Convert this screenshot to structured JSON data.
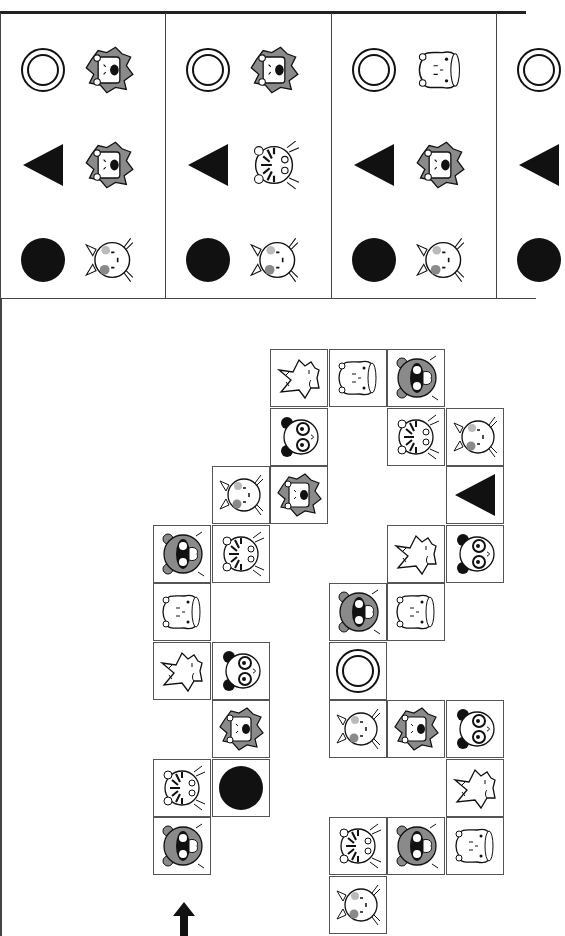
{
  "puzzle": {
    "type": "animal-path-grid",
    "key_panels": [
      {
        "rows": [
          {
            "symbol": "ring",
            "animal": "lion"
          },
          {
            "symbol": "triangle",
            "animal": "lion"
          },
          {
            "symbol": "dot",
            "animal": "cat"
          }
        ]
      },
      {
        "rows": [
          {
            "symbol": "ring",
            "animal": "lion"
          },
          {
            "symbol": "triangle",
            "animal": "tiger"
          },
          {
            "symbol": "dot",
            "animal": "cat"
          }
        ]
      },
      {
        "rows": [
          {
            "symbol": "ring",
            "animal": "hippo"
          },
          {
            "symbol": "triangle",
            "animal": "lion"
          },
          {
            "symbol": "dot",
            "animal": "cat"
          }
        ]
      },
      {
        "rows": [
          {
            "symbol": "ring",
            "animal": ""
          },
          {
            "symbol": "triangle",
            "animal": ""
          },
          {
            "symbol": "dot",
            "animal": ""
          }
        ]
      }
    ],
    "grid": {
      "cell_size": 58.5,
      "origin_x": 153,
      "origin_y": 349,
      "cells": [
        {
          "r": 0,
          "c": 2,
          "item": "fox"
        },
        {
          "r": 0,
          "c": 3,
          "item": "hippo"
        },
        {
          "r": 0,
          "c": 4,
          "item": "raccoon"
        },
        {
          "r": 1,
          "c": 2,
          "item": "panda"
        },
        {
          "r": 1,
          "c": 4,
          "item": "tiger"
        },
        {
          "r": 1,
          "c": 5,
          "item": "cat"
        },
        {
          "r": 2,
          "c": 1,
          "item": "cat"
        },
        {
          "r": 2,
          "c": 2,
          "item": "lion"
        },
        {
          "r": 2,
          "c": 5,
          "item": "triangle"
        },
        {
          "r": 3,
          "c": 0,
          "item": "raccoon"
        },
        {
          "r": 3,
          "c": 1,
          "item": "tiger"
        },
        {
          "r": 3,
          "c": 4,
          "item": "fox"
        },
        {
          "r": 3,
          "c": 5,
          "item": "panda"
        },
        {
          "r": 4,
          "c": 0,
          "item": "hippo"
        },
        {
          "r": 4,
          "c": 3,
          "item": "raccoon"
        },
        {
          "r": 4,
          "c": 4,
          "item": "hippo"
        },
        {
          "r": 5,
          "c": 0,
          "item": "fox"
        },
        {
          "r": 5,
          "c": 1,
          "item": "panda"
        },
        {
          "r": 5,
          "c": 3,
          "item": "ring"
        },
        {
          "r": 6,
          "c": 1,
          "item": "lion"
        },
        {
          "r": 6,
          "c": 3,
          "item": "cat"
        },
        {
          "r": 6,
          "c": 4,
          "item": "lion"
        },
        {
          "r": 6,
          "c": 5,
          "item": "panda"
        },
        {
          "r": 7,
          "c": 0,
          "item": "tiger"
        },
        {
          "r": 7,
          "c": 1,
          "item": "dot"
        },
        {
          "r": 7,
          "c": 5,
          "item": "fox"
        },
        {
          "r": 8,
          "c": 0,
          "item": "raccoon"
        },
        {
          "r": 8,
          "c": 3,
          "item": "tiger"
        },
        {
          "r": 8,
          "c": 4,
          "item": "raccoon"
        },
        {
          "r": 8,
          "c": 5,
          "item": "hippo"
        },
        {
          "r": 9,
          "c": 3,
          "item": "cat"
        }
      ]
    },
    "start_arrow": {
      "direction": "up",
      "x": 184,
      "y": 918
    },
    "colors": {
      "ink": "#111111",
      "gray": "#8a8a8a",
      "border": "#555555",
      "bg": "#ffffff"
    }
  }
}
